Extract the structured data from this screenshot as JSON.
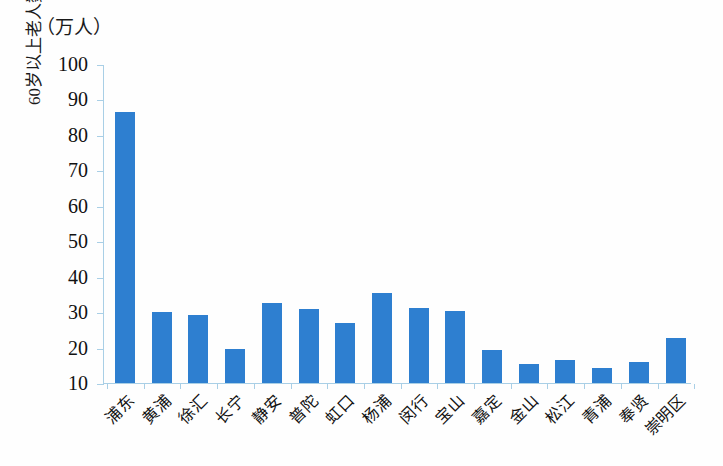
{
  "chart_data": {
    "type": "bar",
    "title": "",
    "unit_label": "（万人）",
    "xlabel": "",
    "ylabel": "60岁以上老人数量",
    "ylim": [
      10,
      100
    ],
    "ytick_step": 10,
    "yticks": [
      100,
      90,
      80,
      70,
      60,
      50,
      40,
      30,
      20,
      10
    ],
    "grid": false,
    "legend": "none",
    "bar_color": "#2e7fd0",
    "axis_color": "#a9cfe6",
    "categories": [
      "浦东",
      "黄浦",
      "徐汇",
      "长宁",
      "静安",
      "普陀",
      "虹口",
      "杨浦",
      "闵行",
      "宝山",
      "嘉定",
      "金山",
      "松江",
      "青浦",
      "奉贤",
      "崇明区"
    ],
    "values": [
      86.5,
      30.0,
      29.2,
      19.6,
      32.5,
      31.0,
      26.8,
      35.5,
      31.3,
      30.2,
      19.2,
      15.3,
      16.6,
      14.1,
      15.8,
      22.8
    ]
  }
}
